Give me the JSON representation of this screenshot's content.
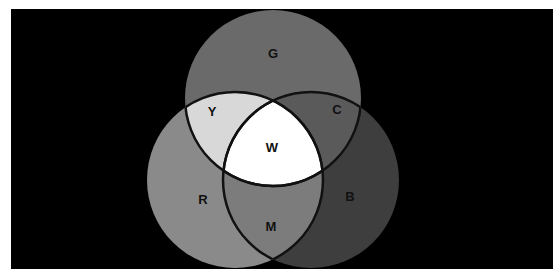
{
  "diagram": {
    "type": "venn",
    "title": "",
    "background": "#000000",
    "sets": [
      {
        "id": "R",
        "label": "R",
        "color": "#8a8a8a",
        "cx": 235,
        "cy": 180,
        "r": 88
      },
      {
        "id": "G",
        "label": "G",
        "color": "#6a6a6a",
        "cx": 273,
        "cy": 98,
        "r": 88
      },
      {
        "id": "B",
        "label": "B",
        "color": "#3e3e3e",
        "cx": 311,
        "cy": 180,
        "r": 88
      }
    ],
    "regions": [
      {
        "id": "Y",
        "label": "Y",
        "sets": [
          "R",
          "G"
        ],
        "color": "#d8d8d8"
      },
      {
        "id": "C",
        "label": "C",
        "sets": [
          "G",
          "B"
        ],
        "color": "#5a5a5a"
      },
      {
        "id": "M",
        "label": "M",
        "sets": [
          "R",
          "B"
        ],
        "color": "#7c7c7c"
      },
      {
        "id": "W",
        "label": "W",
        "sets": [
          "R",
          "G",
          "B"
        ],
        "color": "#ffffff"
      }
    ],
    "labels": {
      "G": "G",
      "Y": "Y",
      "C": "C",
      "W": "W",
      "R": "R",
      "B": "B",
      "M": "M"
    }
  }
}
